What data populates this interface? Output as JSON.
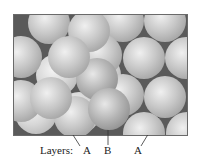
{
  "figure": {
    "frame": {
      "x": 13,
      "y": 14,
      "width": 175,
      "height": 122,
      "gap_color": "#5a5a5a",
      "border_color": "#6a6a6a"
    },
    "sphere_radius": 21,
    "spheres": [
      {
        "layer": "A-bottom",
        "cx": 35,
        "cy": 112,
        "tone": "light"
      },
      {
        "layer": "A-bottom",
        "cx": 78,
        "cy": 112,
        "tone": "light"
      },
      {
        "layer": "A-bottom",
        "cx": 56,
        "cy": 74,
        "tone": "light"
      },
      {
        "layer": "A-bottom",
        "cx": 99,
        "cy": 74,
        "tone": "light"
      },
      {
        "layer": "A",
        "cx": 122,
        "cy": 20,
        "tone": "mid"
      },
      {
        "layer": "A",
        "cx": 164,
        "cy": 20,
        "tone": "mid"
      },
      {
        "layer": "A",
        "cx": 100,
        "cy": 54,
        "tone": "mid"
      },
      {
        "layer": "A",
        "cx": 143,
        "cy": 57,
        "tone": "mid"
      },
      {
        "layer": "A",
        "cx": 185,
        "cy": 57,
        "tone": "mid"
      },
      {
        "layer": "A",
        "cx": 122,
        "cy": 94,
        "tone": "mid"
      },
      {
        "layer": "A",
        "cx": 164,
        "cy": 96,
        "tone": "mid"
      },
      {
        "layer": "A",
        "cx": 143,
        "cy": 132,
        "tone": "mid"
      },
      {
        "layer": "A",
        "cx": 186,
        "cy": 132,
        "tone": "mid"
      },
      {
        "layer": "A",
        "cx": 48,
        "cy": 22,
        "tone": "mid"
      },
      {
        "layer": "A",
        "cx": 20,
        "cy": 56,
        "tone": "mid"
      },
      {
        "layer": "A",
        "cx": 20,
        "cy": 100,
        "tone": "mid"
      },
      {
        "layer": "A",
        "cx": 74,
        "cy": 116,
        "tone": "mid"
      },
      {
        "layer": "B",
        "cx": 88,
        "cy": 30,
        "tone": "mid"
      },
      {
        "layer": "B",
        "cx": 96,
        "cy": 78,
        "tone": "dark"
      },
      {
        "layer": "A",
        "cx": 68,
        "cy": 56,
        "tone": "mid"
      },
      {
        "layer": "A-top",
        "cx": 50,
        "cy": 97,
        "tone": "mid"
      },
      {
        "layer": "B",
        "cx": 108,
        "cy": 108,
        "tone": "dark"
      }
    ],
    "leaders": [
      {
        "from": [
          49,
          97
        ],
        "to": [
          80,
          146
        ]
      },
      {
        "from": [
          108,
          107
        ],
        "to": [
          108,
          145
        ]
      },
      {
        "from": [
          170,
          98
        ],
        "to": [
          141,
          146
        ]
      }
    ]
  },
  "caption": {
    "prefix": "Layers:",
    "labels": [
      {
        "text": "A",
        "x": 83
      },
      {
        "text": "B",
        "x": 105
      },
      {
        "text": "A",
        "x": 133
      }
    ]
  }
}
